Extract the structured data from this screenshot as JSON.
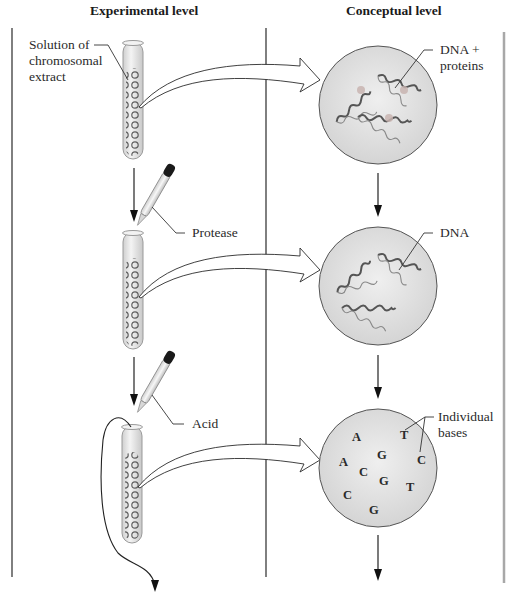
{
  "columns": {
    "experimental": {
      "title": "Experimental level"
    },
    "conceptual": {
      "title": "Conceptual level"
    }
  },
  "steps": [
    {
      "tube_label": "Solution of\nchromosomal\nextract",
      "tube_label_lines": [
        "Solution of",
        "chromosomal",
        "extract"
      ],
      "reagent": "",
      "concept_label_lines": [
        "DNA +",
        "proteins"
      ],
      "concept_contents": "dna-with-proteins"
    },
    {
      "tube_label_lines": [],
      "reagent": "Protease",
      "concept_label_lines": [
        "DNA"
      ],
      "concept_contents": "dna-strands"
    },
    {
      "tube_label_lines": [],
      "reagent": "Acid",
      "concept_label_lines": [
        "Individual",
        "bases"
      ],
      "concept_contents": "individual-bases"
    }
  ],
  "bases": [
    {
      "letter": "A",
      "x": 352,
      "y": 437
    },
    {
      "letter": "T",
      "x": 400,
      "y": 435
    },
    {
      "letter": "G",
      "x": 377,
      "y": 455
    },
    {
      "letter": "A",
      "x": 339,
      "y": 462
    },
    {
      "letter": "C",
      "x": 417,
      "y": 460
    },
    {
      "letter": "C",
      "x": 359,
      "y": 472
    },
    {
      "letter": "G",
      "x": 379,
      "y": 481
    },
    {
      "letter": "T",
      "x": 406,
      "y": 487
    },
    {
      "letter": "C",
      "x": 343,
      "y": 495
    },
    {
      "letter": "G",
      "x": 369,
      "y": 510
    }
  ],
  "colors": {
    "line": "#2b2b2b",
    "circle_fill": "#dcdcdc",
    "circle_stroke": "#555555",
    "tube_glass": "#e4e4e4",
    "chromatin": "#6a6a6a",
    "protein_spot": "#c8b4b0",
    "dropper_bulb": "#1a1a1a",
    "right_border": "#a8a8a8"
  }
}
